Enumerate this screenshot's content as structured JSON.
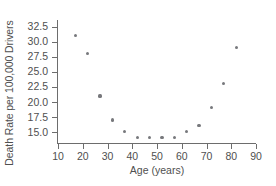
{
  "chart_data": {
    "type": "scatter",
    "title": "",
    "xlabel": "Age (years)",
    "ylabel": "Death Rate per 100,000 Drivers",
    "xlim": [
      10,
      90
    ],
    "ylim": [
      13.2,
      33.6
    ],
    "xticks": [
      10,
      20,
      30,
      40,
      50,
      60,
      70,
      80,
      90
    ],
    "yticks": [
      15.0,
      17.5,
      20.0,
      22.5,
      25.0,
      27.5,
      30.0,
      32.5
    ],
    "xtick_labels": [
      "10",
      "20",
      "30",
      "40",
      "50",
      "60",
      "70",
      "80",
      "90"
    ],
    "ytick_labels": [
      "15.0",
      "17.5",
      "20.0",
      "22.5",
      "25.0",
      "27.5",
      "30.0",
      "32.5"
    ],
    "grid": false,
    "legend": false,
    "marker_color": "#77787c",
    "axis_color": "#6d6d6d",
    "points": [
      {
        "x": 17,
        "y": 31.0
      },
      {
        "x": 22,
        "y": 28.0
      },
      {
        "x": 27,
        "y": 21.0
      },
      {
        "x": 32,
        "y": 17.0
      },
      {
        "x": 37,
        "y": 15.1
      },
      {
        "x": 42,
        "y": 14.1
      },
      {
        "x": 47,
        "y": 14.1
      },
      {
        "x": 52,
        "y": 14.1
      },
      {
        "x": 57,
        "y": 14.1
      },
      {
        "x": 62,
        "y": 15.1
      },
      {
        "x": 67,
        "y": 16.1
      },
      {
        "x": 72,
        "y": 19.1
      },
      {
        "x": 77,
        "y": 23.1
      },
      {
        "x": 82,
        "y": 29.1
      }
    ]
  }
}
